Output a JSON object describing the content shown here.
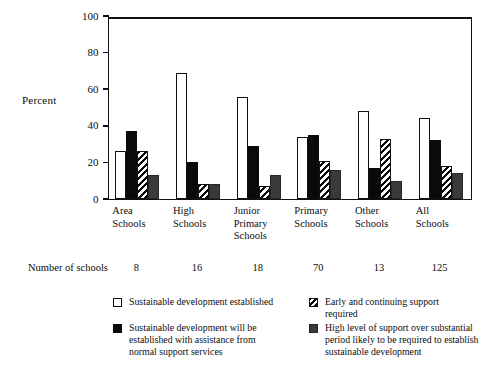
{
  "chart_data": {
    "type": "bar",
    "title": "",
    "subtitle": "",
    "xlabel": "",
    "ylabel": "Percent",
    "ylim": [
      0,
      100
    ],
    "yticks": [
      0,
      20,
      40,
      60,
      80,
      100
    ],
    "grid": false,
    "legend_position": "bottom",
    "categories": [
      "Area\nSchools",
      "High\nSchools",
      "Junior\nPrimary\nSchools",
      "Primary\nSchools",
      "Other\nSchools",
      "All\nSchools"
    ],
    "series": [
      {
        "name": "Sustainable development established",
        "style": "white",
        "values": [
          26,
          69,
          56,
          34,
          48,
          44
        ]
      },
      {
        "name": "Sustainable development will be established with assistance from normal support services",
        "style": "black",
        "values": [
          37,
          20,
          29,
          35,
          17,
          32
        ]
      },
      {
        "name": "Early and continuing support required",
        "style": "hatch",
        "values": [
          26,
          8,
          7,
          21,
          33,
          18
        ]
      },
      {
        "name": "High level of support over substantial period likely to be required to establish sustainable development",
        "style": "gray",
        "values": [
          13,
          8,
          13,
          16,
          10,
          14
        ]
      }
    ],
    "annotations": {
      "schools_row_label": "Number of schools",
      "schools_counts": [
        8,
        16,
        18,
        70,
        13,
        125
      ]
    }
  },
  "axis": {
    "y_title": "Percent",
    "y_tick_labels": [
      "100",
      "80",
      "60",
      "40",
      "20",
      "0"
    ]
  },
  "x_labels": [
    "Area\nSchools",
    "High\nSchools",
    "Junior\nPrimary\nSchools",
    "Primary\nSchools",
    "Other\nSchools",
    "All\nSchools"
  ],
  "schools": {
    "label": "Number of schools",
    "counts": [
      "8",
      "16",
      "18",
      "70",
      "13",
      "125"
    ]
  },
  "legend": {
    "items": [
      {
        "swatch": "white",
        "text": "Sustainable development established"
      },
      {
        "swatch": "hatch",
        "text": "Early and continuing support\nrequired"
      },
      {
        "swatch": "black",
        "text": "Sustainable development will be\nestablished with assistance from\nnormal support services"
      },
      {
        "swatch": "gray",
        "text": "High level of support over substantial\nperiod likely to be required to establish\nsustainable development"
      }
    ]
  },
  "colors": {
    "ink": "#0d0d0d",
    "bar_black": "#0a0a0a",
    "bar_gray": "#3a3a3a",
    "bar_white": "#ffffff",
    "background": "#ffffff"
  }
}
